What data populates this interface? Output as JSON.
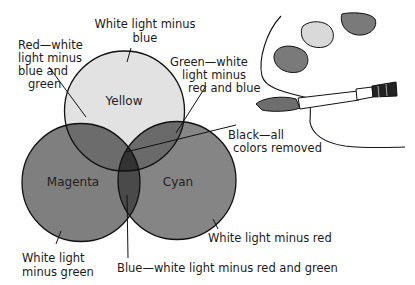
{
  "diagram": {
    "type": "subtractive-color-venn",
    "circles": [
      {
        "name": "Yellow",
        "label": "Yellow",
        "description_lines": [
          "White light minus",
          "blue"
        ],
        "fill": "#e2e2e2"
      },
      {
        "name": "Magenta",
        "label": "Magenta",
        "description_lines": [
          "White light",
          "minus green"
        ],
        "fill": "#7f7f7f"
      },
      {
        "name": "Cyan",
        "label": "Cyan",
        "description_lines": [
          "White light minus red"
        ],
        "fill": "#858585"
      }
    ],
    "overlaps": [
      {
        "name": "Red",
        "description_lines": [
          "Red—white",
          "light minus",
          "blue and",
          "green"
        ],
        "fill": "#6c6c6c"
      },
      {
        "name": "Green",
        "description_lines": [
          "Green—white",
          "light minus",
          "red and blue"
        ],
        "fill": "#6a6a6a"
      },
      {
        "name": "Blue",
        "description_lines": [
          "Blue—white light minus red and green"
        ],
        "fill": "#5a5a5a"
      },
      {
        "name": "Black",
        "description_lines": [
          "Black—all",
          "colors removed"
        ],
        "fill": "#3a3a3a"
      }
    ],
    "illustration": {
      "palette_paint_blobs": 3,
      "paintbrush": true
    }
  },
  "labels": {
    "yellow": "Yellow",
    "magenta": "Magenta",
    "cyan": "Cyan",
    "yellow_desc_1": "White light minus",
    "yellow_desc_2": "blue",
    "red_desc_1": "Red—white",
    "red_desc_2": "light minus",
    "red_desc_3": "blue and",
    "red_desc_4": "green",
    "green_desc_1": "Green—white",
    "green_desc_2": "light minus",
    "green_desc_3": "red and blue",
    "black_desc_1": "Black—all",
    "black_desc_2": "colors removed",
    "magenta_desc_1": "White light",
    "magenta_desc_2": "minus green",
    "cyan_desc_1": "White light minus red",
    "blue_desc_1": "Blue—white light minus red and green"
  }
}
